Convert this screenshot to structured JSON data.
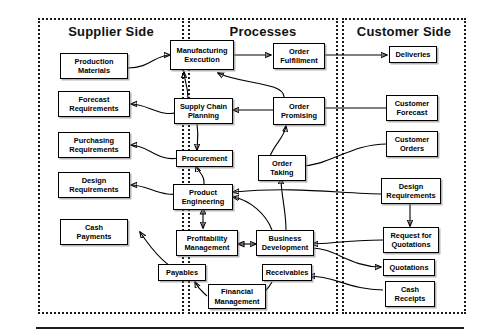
{
  "diagram": {
    "panels": [
      {
        "id": "supplier",
        "title": "Supplier Side"
      },
      {
        "id": "processes",
        "title": "Processes"
      },
      {
        "id": "customer",
        "title": "Customer Side"
      }
    ],
    "nodes": {
      "production_materials": "Production\nMaterials",
      "forecast_requirements": "Forecast\nRequirements",
      "purchasing_requirements": "Purchasing\nRequirements",
      "design_requirements_supplier": "Design\nRequirements",
      "cash_payments": "Cash\nPayments",
      "manufacturing_execution": "Manufacturing\nExecution",
      "order_fulfillment": "Order\nFulfillment",
      "supply_chain_planning": "Supply Chain\nPlanning",
      "order_promising": "Order\nPromising",
      "procurement": "Procurement",
      "order_taking": "Order\nTaking",
      "product_engineering": "Product\nEngineering",
      "profitability_management": "Profitability\nManagement",
      "business_development": "Business\nDevelopment",
      "payables": "Payables",
      "financial_management": "Financial\nManagement",
      "receivables": "Receivables",
      "deliveries": "Deliveries",
      "customer_forecast": "Customer\nForecast",
      "customer_orders": "Customer\nOrders",
      "design_requirements_customer": "Design\nRequirements",
      "request_for_quotations": "Request for\nQuotations",
      "quotations": "Quotations",
      "cash_receipts": "Cash\nReceipts"
    },
    "colors": {
      "line": "#000000",
      "panel_border": "#1a1a1a",
      "node_fill": "#ffffff",
      "text": "#000000"
    }
  }
}
